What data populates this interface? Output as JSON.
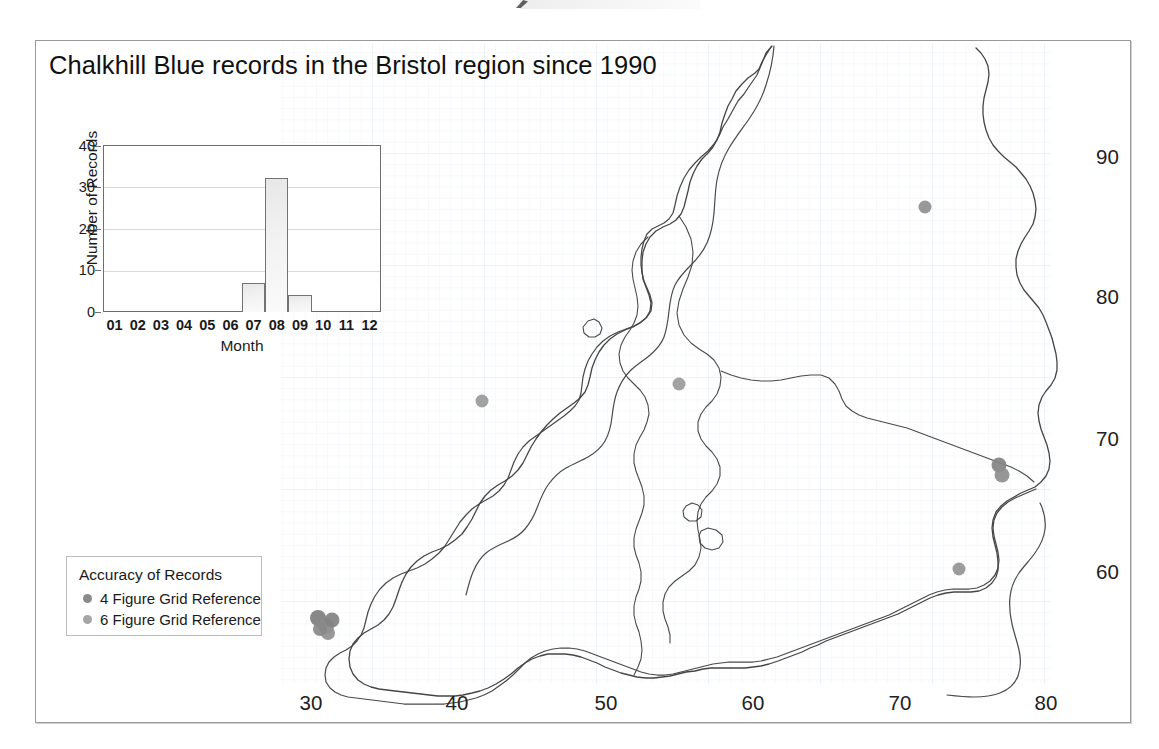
{
  "figure": {
    "title": "Chalkhill Blue records in the Bristol region since 1990"
  },
  "map": {
    "x_ticks": [
      "30",
      "40",
      "50",
      "60",
      "70",
      "80"
    ],
    "y_ticks": [
      "90",
      "80",
      "70",
      "60"
    ],
    "grid": "faint 1 km grid",
    "outline_color": "#4a4a4a",
    "grid_color": "#e8ecf2",
    "point_colors": {
      "four_figure": "#8a8a8a",
      "six_figure": "#9d9d9d"
    },
    "points": [
      {
        "x": 74.0,
        "y": 87.8,
        "accuracy": "6 Figure Grid Reference"
      },
      {
        "x": 42.6,
        "y": 74.2,
        "accuracy": "6 Figure Grid Reference"
      },
      {
        "x": 56.4,
        "y": 75.0,
        "accuracy": "6 Figure Grid Reference"
      },
      {
        "x": 79.2,
        "y": 69.1,
        "accuracy": "4 Figure Grid Reference"
      },
      {
        "x": 79.0,
        "y": 68.4,
        "accuracy": "6 Figure Grid Reference"
      },
      {
        "x": 76.6,
        "y": 61.2,
        "accuracy": "6 Figure Grid Reference"
      },
      {
        "x": 31.2,
        "y": 58.6,
        "accuracy": "4 Figure Grid Reference"
      },
      {
        "x": 31.5,
        "y": 58.3,
        "accuracy": "6 Figure Grid Reference"
      },
      {
        "x": 31.9,
        "y": 58.5,
        "accuracy": "4 Figure Grid Reference"
      },
      {
        "x": 32.0,
        "y": 58.1,
        "accuracy": "6 Figure Grid Reference"
      },
      {
        "x": 31.7,
        "y": 58.0,
        "accuracy": "6 Figure Grid Reference"
      }
    ]
  },
  "legend": {
    "title": "Accuracy of Records",
    "items": [
      {
        "label": "4 Figure Grid Reference",
        "color": "#8a8a8a"
      },
      {
        "label": "6 Figure Grid Reference",
        "color": "#a6a6a6"
      }
    ]
  },
  "chart_data": {
    "type": "bar",
    "title": "",
    "categories": [
      "01",
      "02",
      "03",
      "04",
      "05",
      "06",
      "07",
      "08",
      "09",
      "10",
      "11",
      "12"
    ],
    "values": [
      0,
      0,
      0,
      0,
      0,
      0,
      7,
      32,
      4,
      0,
      0,
      0
    ],
    "xlabel": "Month",
    "ylabel": "Number of Records",
    "ylim": [
      0,
      40
    ],
    "yticks": [
      "0",
      "10",
      "20",
      "30",
      "40"
    ],
    "grid": "horizontal gridlines at 10, 20, 30",
    "legend": "none",
    "bar_fill": "#f0f0f0",
    "bar_border": "#737373"
  }
}
